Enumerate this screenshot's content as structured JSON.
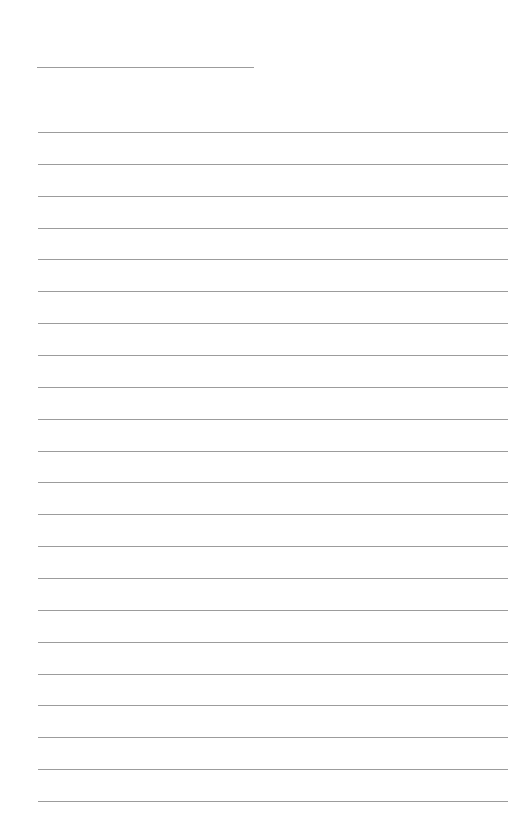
{
  "document": {
    "type": "lined-paper",
    "title_line": {
      "x": 37,
      "y": 67,
      "width": 217
    },
    "rules": {
      "count": 22,
      "start_y": 132,
      "spacing": 31.86,
      "x": 38,
      "width": 470
    },
    "colors": {
      "background": "#ffffff",
      "line": "#9c9c9c"
    }
  }
}
